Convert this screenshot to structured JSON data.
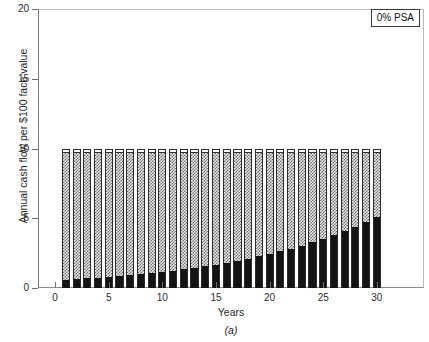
{
  "figure": {
    "caption": "(a)",
    "legend_label": "0% PSA"
  },
  "chart_data": {
    "type": "bar",
    "stacked": true,
    "title": "",
    "subtitle": "",
    "xlabel": "Years",
    "ylabel": "Annual cash flow per $100 face value",
    "xlim": [
      -1.6,
      34.4
    ],
    "ylim": [
      0,
      20
    ],
    "xticks": [
      0,
      5,
      10,
      15,
      20,
      25,
      30
    ],
    "yticks": [
      0,
      5,
      10,
      15,
      20
    ],
    "grid": false,
    "legend_position": "top-right",
    "annotations": [
      "0% PSA",
      "(a)"
    ],
    "categories": [
      1,
      2,
      3,
      4,
      5,
      6,
      7,
      8,
      9,
      10,
      11,
      12,
      13,
      14,
      15,
      16,
      17,
      18,
      19,
      20,
      21,
      22,
      23,
      24,
      25,
      26,
      27,
      28,
      29,
      30
    ],
    "series": [
      {
        "name": "Principal",
        "fill": "solid-black",
        "color": "#141414",
        "values": [
          0.6,
          0.64,
          0.69,
          0.75,
          0.8,
          0.86,
          0.93,
          1.0,
          1.08,
          1.16,
          1.25,
          1.34,
          1.45,
          1.56,
          1.68,
          1.81,
          1.95,
          2.1,
          2.26,
          2.43,
          2.62,
          2.82,
          3.04,
          3.27,
          3.52,
          3.79,
          4.09,
          4.4,
          4.74,
          5.1
        ]
      },
      {
        "name": "Interest",
        "fill": "hatched-gray",
        "color": "#e4e4e4",
        "values": [
          9.05,
          9.01,
          8.96,
          8.9,
          8.85,
          8.79,
          8.72,
          8.65,
          8.57,
          8.49,
          8.4,
          8.31,
          8.2,
          8.09,
          7.97,
          7.84,
          7.7,
          7.55,
          7.39,
          7.22,
          7.03,
          6.83,
          6.61,
          6.38,
          6.13,
          5.86,
          5.56,
          5.25,
          4.91,
          4.55
        ]
      },
      {
        "name": "Servicing",
        "fill": "white",
        "color": "#ffffff",
        "values": [
          0.35,
          0.35,
          0.35,
          0.35,
          0.35,
          0.35,
          0.35,
          0.35,
          0.35,
          0.35,
          0.35,
          0.35,
          0.35,
          0.35,
          0.35,
          0.35,
          0.35,
          0.35,
          0.35,
          0.35,
          0.35,
          0.35,
          0.35,
          0.35,
          0.35,
          0.35,
          0.35,
          0.35,
          0.35,
          0.35
        ]
      }
    ],
    "totals": [
      10.0,
      10.0,
      10.0,
      10.0,
      10.0,
      10.0,
      10.0,
      10.0,
      10.0,
      10.0,
      10.0,
      10.0,
      10.0,
      10.0,
      10.0,
      10.0,
      10.0,
      10.0,
      10.0,
      10.0,
      10.0,
      10.0,
      10.0,
      10.0,
      10.0,
      10.0,
      10.0,
      10.0,
      10.0,
      10.0
    ]
  }
}
